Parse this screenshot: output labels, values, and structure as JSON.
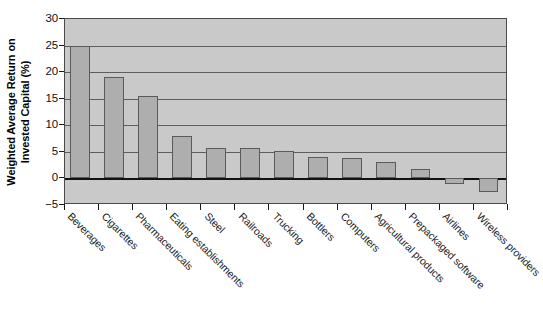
{
  "chart_data": {
    "type": "bar",
    "title": "",
    "xlabel": "",
    "ylabel": "Weighted Average Return on Invested Capital (%)",
    "ylabel_lines": [
      "Weighted Average Return on",
      "Invested Capital (%)"
    ],
    "ylim": [
      -5,
      30
    ],
    "yticks": [
      30,
      25,
      20,
      15,
      10,
      5,
      0,
      -5
    ],
    "ytick_labels": [
      "30",
      "25",
      "20",
      "15",
      "10",
      "5",
      "0",
      "−5"
    ],
    "grid": true,
    "legend": false,
    "categories": [
      "Beverages",
      "Cigarettes",
      "Pharmaceuticals",
      "Eating establishments",
      "Steel",
      "Railroads",
      "Trucking",
      "Bottlers",
      "Computers",
      "Agricultural products",
      "Prepackaged software",
      "Airlines",
      "Wireless providers"
    ],
    "values": [
      25.0,
      19.0,
      15.6,
      8.0,
      5.8,
      5.8,
      5.2,
      4.0,
      3.8,
      3.1,
      1.7,
      -1.0,
      -2.5
    ],
    "bar_color": "#aeaeae",
    "bar_edge_color": "#5a5a5a",
    "plot_background": "#c9c9c9",
    "gridline_color": "#5d5d5d",
    "axis_color": "#111111"
  }
}
